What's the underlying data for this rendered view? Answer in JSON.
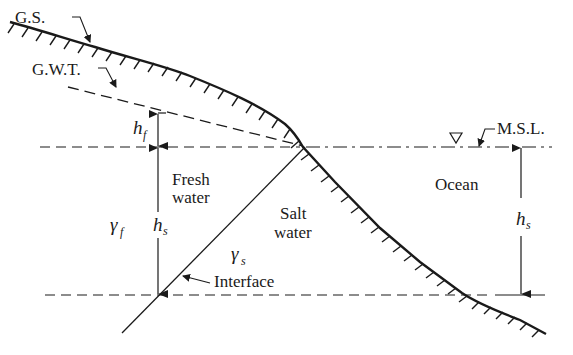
{
  "diagram": {
    "type": "hydrogeology cross-section",
    "labels": {
      "ground_surface": "G.S.",
      "groundwater_table": "G.W.T.",
      "mean_sea_level": "M.S.L.",
      "fresh_water_1": "Fresh",
      "fresh_water_2": "water",
      "salt_water_1": "Salt",
      "salt_water_2": "water",
      "ocean": "Ocean",
      "interface": "Interface"
    },
    "symbols": {
      "hf_main": "h",
      "hf_sub": "f",
      "hs_left_main": "h",
      "hs_left_sub": "s",
      "hs_right_main": "h",
      "hs_right_sub": "s",
      "gamma_f_main": "γ",
      "gamma_f_sub": "f",
      "gamma_s_main": "γ",
      "gamma_s_sub": "s"
    },
    "water_level_marker": "▽",
    "colors": {
      "line": "#1a1a1a",
      "background": "#ffffff"
    }
  }
}
